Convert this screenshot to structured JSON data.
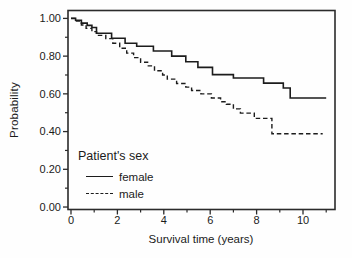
{
  "chart_data": {
    "type": "line",
    "subtype": "kaplan-meier-step",
    "title": "",
    "x_axis": {
      "label": "Survival time (years)",
      "range": [
        -0.129,
        11.379
      ],
      "major_ticks": [
        {
          "value": 0,
          "label": "0"
        },
        {
          "value": 2,
          "label": "2"
        },
        {
          "value": 4,
          "label": "4"
        },
        {
          "value": 6,
          "label": "6"
        },
        {
          "value": 8,
          "label": "8"
        },
        {
          "value": 10,
          "label": "10"
        }
      ],
      "minor_ticks": [
        1,
        3,
        5,
        7,
        9,
        11
      ]
    },
    "y_axis": {
      "label": "Probability",
      "range": [
        -0.0131,
        1.0419
      ],
      "major_ticks": [
        {
          "value": 0.0,
          "label": "0.00"
        },
        {
          "value": 0.2,
          "label": "0.20"
        },
        {
          "value": 0.4,
          "label": "0.40"
        },
        {
          "value": 0.6,
          "label": "0.60"
        },
        {
          "value": 0.8,
          "label": "0.80"
        },
        {
          "value": 1.0,
          "label": "1.00"
        }
      ],
      "minor_ticks": [
        0.1,
        0.3,
        0.5,
        0.7,
        0.9
      ]
    },
    "legend": {
      "title": "Patient's sex",
      "position": "inside-bottom-left",
      "entries": [
        {
          "label": "female",
          "style": "solid"
        },
        {
          "label": "male",
          "style": "dashed"
        }
      ]
    },
    "line_color": "#1c1c1c",
    "grid": false,
    "series": [
      {
        "name": "female",
        "style": "solid",
        "end_time": 11.0,
        "step_points": [
          [
            0.0,
            1.0
          ],
          [
            0.2,
            0.99
          ],
          [
            0.45,
            0.975
          ],
          [
            0.7,
            0.963
          ],
          [
            0.9,
            0.952
          ],
          [
            1.1,
            0.921
          ],
          [
            1.75,
            0.895
          ],
          [
            2.33,
            0.868
          ],
          [
            2.83,
            0.852
          ],
          [
            3.55,
            0.827
          ],
          [
            4.34,
            0.8
          ],
          [
            4.95,
            0.77
          ],
          [
            5.47,
            0.74
          ],
          [
            6.1,
            0.702
          ],
          [
            7.0,
            0.684
          ],
          [
            8.3,
            0.657
          ],
          [
            9.15,
            0.631
          ],
          [
            9.45,
            0.578
          ]
        ]
      },
      {
        "name": "male",
        "style": "dashed",
        "end_time": 10.85,
        "step_points": [
          [
            0.0,
            1.0
          ],
          [
            0.2,
            0.986
          ],
          [
            0.45,
            0.965
          ],
          [
            0.65,
            0.947
          ],
          [
            0.9,
            0.93
          ],
          [
            1.1,
            0.91
          ],
          [
            1.5,
            0.893
          ],
          [
            1.8,
            0.868
          ],
          [
            2.1,
            0.842
          ],
          [
            2.4,
            0.816
          ],
          [
            2.7,
            0.792
          ],
          [
            3.0,
            0.768
          ],
          [
            3.3,
            0.748
          ],
          [
            3.6,
            0.722
          ],
          [
            3.95,
            0.7
          ],
          [
            4.15,
            0.678
          ],
          [
            4.55,
            0.655
          ],
          [
            4.95,
            0.636
          ],
          [
            5.2,
            0.618
          ],
          [
            5.6,
            0.6
          ],
          [
            6.05,
            0.578
          ],
          [
            6.45,
            0.558
          ],
          [
            6.7,
            0.545
          ],
          [
            7.0,
            0.52
          ],
          [
            7.3,
            0.498
          ],
          [
            7.9,
            0.47
          ],
          [
            8.66,
            0.388
          ]
        ]
      }
    ]
  }
}
